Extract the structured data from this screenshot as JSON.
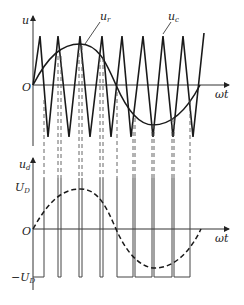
{
  "diagram": {
    "title": "",
    "type": "PWM waveform (bipolar sinusoidal PWM)",
    "top_plot": {
      "y_axis_label": "u",
      "x_axis_label": "ωt",
      "origin_label": "O",
      "reference_label": "u",
      "reference_sub": "r",
      "carrier_label": "u",
      "carrier_sub": "c"
    },
    "bottom_plot": {
      "y_axis_label": "u",
      "y_axis_sub": "d",
      "x_axis_label": "ωt",
      "origin_label": "O",
      "pos_level_label": "U",
      "pos_level_sub": "D",
      "neg_level_label": "−U",
      "neg_level_sub": "D"
    },
    "colors": {
      "line": "#1a1a1a",
      "axis": "#333333",
      "dashed": "#555555"
    }
  }
}
